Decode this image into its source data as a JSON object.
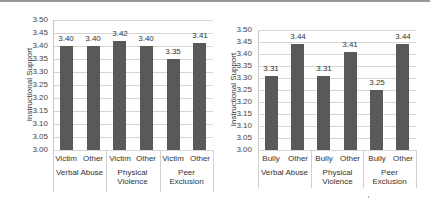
{
  "chart_data": [
    {
      "type": "bar",
      "title": "",
      "ylabel": "Instructional Support",
      "xlabel": "",
      "ylim": [
        3.0,
        3.5
      ],
      "yticks": [
        "3.50",
        "3.45",
        "3.40",
        "3.35",
        "3.30",
        "3.25",
        "3.20",
        "3.15",
        "3.10",
        "3.05",
        "3.00"
      ],
      "grid": true,
      "groups": [
        "Verbal Abuse",
        "Physical Violence",
        "Peer Exclusion"
      ],
      "categories": [
        "Victim",
        "Other",
        "Victim",
        "Other",
        "Victim",
        "Other"
      ],
      "values": [
        3.4,
        3.4,
        3.42,
        3.4,
        3.35,
        3.41
      ],
      "value_labels": [
        "3.40",
        "3.40",
        "3.42",
        "3.40",
        "3.35",
        "3.41"
      ],
      "bar_color": "#595959"
    },
    {
      "type": "bar",
      "title": "",
      "ylabel": "Instructional Support",
      "xlabel": "",
      "ylim": [
        3.0,
        3.5
      ],
      "yticks": [
        "3.50",
        "3.45",
        "3.40",
        "3.35",
        "3.30",
        "3.25",
        "3.20",
        "3.15",
        "3.10",
        "3.05",
        "3.00"
      ],
      "grid": true,
      "groups": [
        "Verbal Abuse",
        "Physical Violence",
        "Peer Exclusion"
      ],
      "categories": [
        "Bully",
        "Other",
        "Bully",
        "Other",
        "Bully",
        "Other"
      ],
      "values": [
        3.31,
        3.44,
        3.31,
        3.41,
        3.25,
        3.44
      ],
      "value_labels": [
        "3.31",
        "3.44",
        "3.31",
        "3.41",
        "3.25",
        "3.44"
      ],
      "bar_color": "#595959"
    }
  ],
  "left": {
    "ylabel": "Instructional Support",
    "groups": [
      "Verbal Abuse",
      "Physical\nViolence",
      "Peer\nExclusion"
    ]
  },
  "right": {
    "ylabel": "Instructional Support",
    "groups": [
      "Verbal Abuse",
      "Physical\nViolence",
      "Peer Exclusion"
    ]
  }
}
